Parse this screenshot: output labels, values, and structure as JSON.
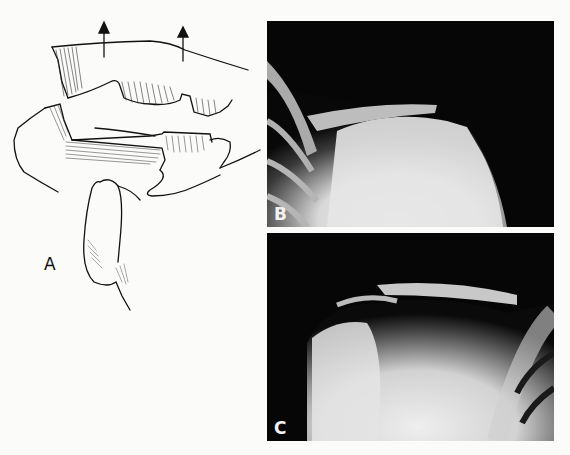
{
  "figure": {
    "panels": [
      {
        "id": "A",
        "label": "A",
        "type": "illustration",
        "description": "Line drawing of acromioclavicular joint with upward arrows indicating clavicle displacement"
      },
      {
        "id": "B",
        "label": "B",
        "type": "x-ray",
        "description": "Radiograph of shoulder showing acromioclavicular separation"
      },
      {
        "id": "C",
        "label": "C",
        "type": "x-ray",
        "description": "Radiograph of contralateral shoulder for comparison"
      }
    ]
  }
}
